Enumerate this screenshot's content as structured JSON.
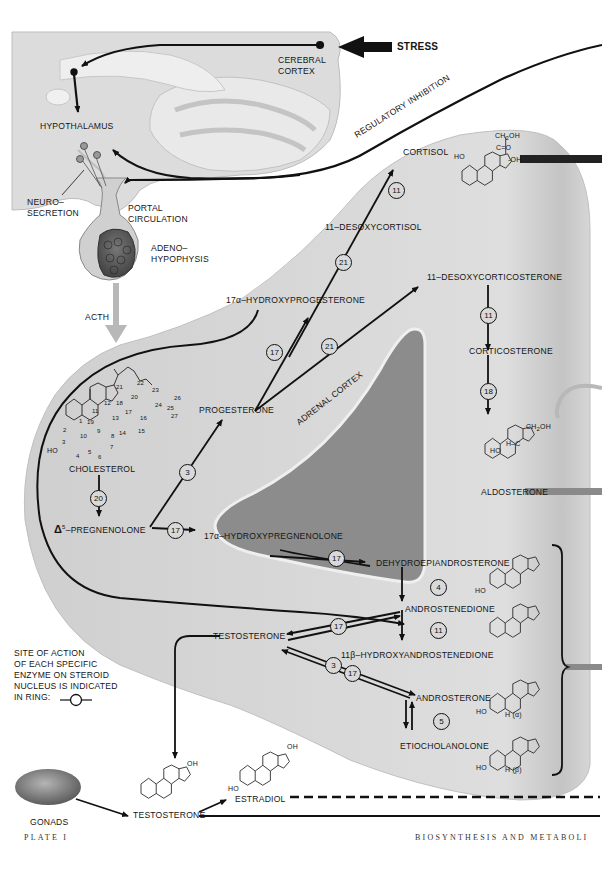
{
  "figure": {
    "plate_label": "PLATE I",
    "page_caption": "BIOSYNTHESIS AND METABOLI",
    "colors": {
      "background": "#ffffff",
      "adrenal_cortex": "#d8d8d8",
      "adrenal_medulla": "#8c8c8c",
      "brain": "#dcdcdc",
      "arrow": "#111111",
      "acth_arrow": "#b8b8b8",
      "output_bars_gray": "#8a8a8a"
    }
  },
  "brain": {
    "cerebral_cortex": "CEREBRAL\nCORTEX",
    "stress": "STRESS",
    "hypothalamus": "HYPOTHALAMUS",
    "neurosecretion": "NEURO–\nSECRETION",
    "portal_circulation": "PORTAL\nCIRCULATION",
    "adenohypophysis": "ADENO–\nHYPOPHYSIS",
    "acth": "ACTH",
    "regulatory_inhibition": "REGULATORY INHIBITION"
  },
  "adrenal": {
    "label": "ADRENAL CORTEX"
  },
  "compounds": {
    "cortisol": "CORTISOL",
    "desoxycortisol": "11–DESOXYCORTISOL",
    "hydroxyprogesterone": "17α–HYDROXYPROGESTERONE",
    "desoxycorticosterone": "11–DESOXYCORTICOSTERONE",
    "progesterone": "PROGESTERONE",
    "corticosterone": "CORTICOSTERONE",
    "aldosterone": "ALDOSTERONE",
    "cholesterol": "CHOLESTEROL",
    "pregnenolone_prefix": "Δ",
    "pregnenolone_sup": "5",
    "pregnenolone": "–PREGNENOLONE",
    "hydroxypregnenolone": "17α–HYDROXYPREGNENOLONE",
    "dhea": "DEHYDROEPIANDROSTERONE",
    "androstenedione": "ANDROSTENEDIONE",
    "hydroxyandrostenedione": "11β–HYDROXYANDROSTENEDIONE",
    "testosterone": "TESTOSTERONE",
    "androsterone": "ANDROSTERONE",
    "etiocholanolone": "ETIOCHOLANOLONE",
    "testosterone_gonadal": "TESTOSTERONE",
    "estradiol": "ESTRADIOL",
    "gonads": "GONADS"
  },
  "cholesterol_numbering": [
    "1",
    "2",
    "3",
    "4",
    "5",
    "6",
    "7",
    "8",
    "9",
    "10",
    "11",
    "12",
    "13",
    "14",
    "15",
    "16",
    "17",
    "18",
    "19",
    "20",
    "21",
    "22",
    "23",
    "24",
    "25",
    "26",
    "27"
  ],
  "structure_labels": {
    "ho": "HO",
    "oh": "OH",
    "ch2oh": "CH",
    "ch2oh_sub": "2",
    "ch2oh_tail": "OH",
    "co": "C=O",
    "oh_side": "-OH",
    "h_c": "H–C",
    "o": "O",
    "h_alpha": "H (α)",
    "h_beta": "H (β)"
  },
  "enzymes": {
    "e11_cortisol": "11",
    "e21_desoxycortisol": "21",
    "e17_hydroxyprog": "17",
    "e21_doc": "21",
    "e11_corticosterone": "11",
    "e18_aldosterone": "18",
    "e3_progesterone": "3",
    "e20_pregnenolone": "20",
    "e17_hydroxypreg": "17",
    "e17_dhea": "17",
    "e4_androstenedione": "4",
    "e11_hydroxyandro": "11",
    "e17_testosterone": "17",
    "e3_androsterone": "3",
    "e17_androsterone": "17",
    "e5_etiocholanolone": "5"
  },
  "legend": {
    "text": "SITE OF ACTION\nOF EACH SPECIFIC\nENZYME ON STEROID\nNUCLEUS IS INDICATED\nIN RING:"
  }
}
